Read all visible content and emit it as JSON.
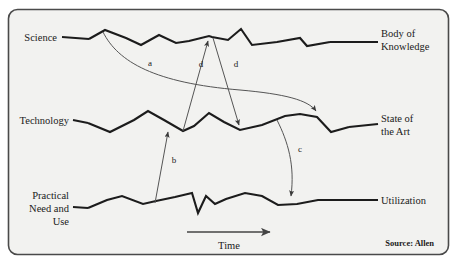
{
  "figure": {
    "source_label": "Source: Allen",
    "time_axis_label": "Time",
    "background_color": "#f2f2f0",
    "border_color": "#4a4a4a",
    "line_color": "#1c1c1c",
    "arrow_color": "#555555"
  },
  "rows": [
    {
      "id": "science",
      "left_label_lines": [
        "Science"
      ],
      "right_label_lines": [
        "Body of",
        "Knowledge"
      ]
    },
    {
      "id": "technology",
      "left_label_lines": [
        "Technology"
      ],
      "right_label_lines": [
        "State of",
        "the Art"
      ]
    },
    {
      "id": "practical-need",
      "left_label_lines": [
        "Practical",
        "Need and",
        "Use"
      ],
      "right_label_lines": [
        "Utilization"
      ]
    }
  ],
  "relations": [
    {
      "id": "a",
      "label": "a",
      "from_row": "science",
      "to_row": "technology"
    },
    {
      "id": "b",
      "label": "b",
      "from_row": "practical-need",
      "to_row": "technology"
    },
    {
      "id": "c",
      "label": "c",
      "from_row": "technology",
      "to_row": "practical-need"
    },
    {
      "id": "d1",
      "label": "d",
      "from_row": "technology",
      "to_row": "science"
    },
    {
      "id": "d2",
      "label": "d",
      "from_row": "science",
      "to_row": "technology"
    }
  ],
  "chart_data": {
    "type": "line",
    "xlabel": "Time",
    "ylabel": "",
    "grid": false,
    "legend_position": "none",
    "annotations": [
      "a",
      "b",
      "c",
      "d",
      "d",
      "Time",
      "Source: Allen"
    ],
    "series": [
      {
        "name": "Science",
        "end_name": "Body of Knowledge",
        "points": "89,39 105,30 126,38 141,45 159,35 176,43 189,41 209,36 212,37 228,40 241,29 252,45 277,42 300,38 307,46 330,42"
      },
      {
        "name": "Technology",
        "end_name": "State of the Art",
        "points": "88,123 110,132 134,120 148,111 164,120 183,131 194,126 209,113 224,122 240,130 262,125 285,116 300,114 317,117 331,132 349,127"
      },
      {
        "name": "Practical Need and Use",
        "end_name": "Utilization",
        "points": "88,208 107,200 122,196 143,204 156,201 175,197 192,193 198,213 206,196 215,204 226,199 245,193 262,196 278,205 297,204 318,200 338,200"
      }
    ]
  }
}
